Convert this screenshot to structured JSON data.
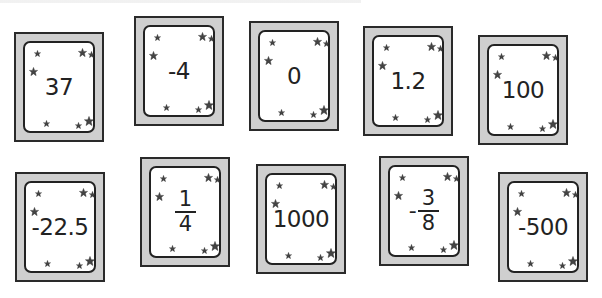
{
  "colors": {
    "frame": "#cfcfcf",
    "frame_border": "#2a2a2a",
    "panel": "#ffffff",
    "panel_border": "#222222",
    "star": "#444444",
    "text": "#222222"
  },
  "cards": [
    {
      "id": 1,
      "label": "37",
      "type": "number"
    },
    {
      "id": 2,
      "label": "-4",
      "type": "number"
    },
    {
      "id": 3,
      "label": "0",
      "type": "number"
    },
    {
      "id": 4,
      "label": "1.2",
      "type": "number"
    },
    {
      "id": 5,
      "label": "100",
      "type": "number"
    },
    {
      "id": 6,
      "label": "-22.5",
      "type": "number"
    },
    {
      "id": 7,
      "label": "1/4",
      "type": "fraction",
      "sign": "",
      "numerator": "1",
      "denominator": "4"
    },
    {
      "id": 8,
      "label": "1000",
      "type": "number"
    },
    {
      "id": 9,
      "label": "-3/8",
      "type": "fraction",
      "sign": "-",
      "numerator": "3",
      "denominator": "8"
    },
    {
      "id": 10,
      "label": "-500",
      "type": "number"
    }
  ],
  "decoration": {
    "icon": "star-icon",
    "stars_per_card": 7
  }
}
